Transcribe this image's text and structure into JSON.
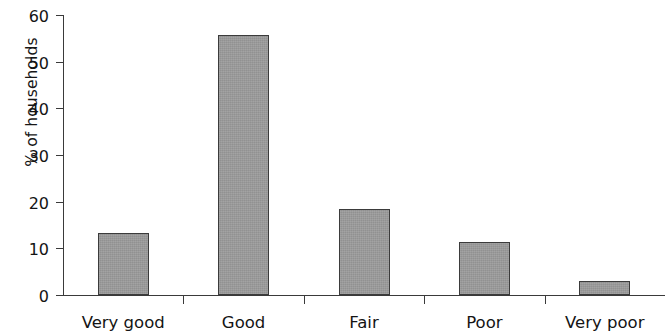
{
  "chart_data": {
    "type": "bar",
    "title": "",
    "subtitle": "",
    "xlabel": "",
    "ylabel": "% of households",
    "categories": [
      "Very good",
      "Good",
      "Fair",
      "Poor",
      "Very poor"
    ],
    "values": [
      13.3,
      55.7,
      18.4,
      11.4,
      3.0
    ],
    "ylim": [
      0,
      60
    ],
    "ytick_labels": [
      "0",
      "10",
      "20",
      "30",
      "40",
      "50",
      "60"
    ],
    "ytick_values": [
      0,
      10,
      20,
      30,
      40,
      50,
      60
    ],
    "grid": false,
    "legend": false,
    "legend_position": "none",
    "bar_fill_color": "#9a9a9a",
    "bar_edge_color": "#3b3b3b",
    "axis_color": "#3a3a3a",
    "background_color": "#ffffff"
  }
}
